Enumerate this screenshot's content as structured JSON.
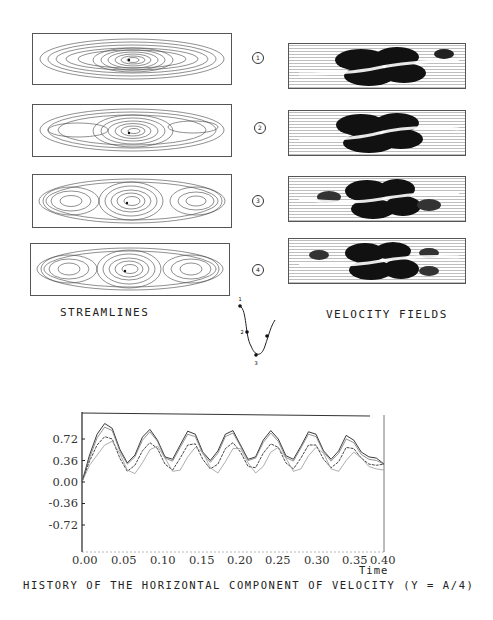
{
  "figure": {
    "streamlines_label": "STREAMLINES",
    "velocity_label": "VELOCITY FIELDS",
    "phase_markers": [
      "1",
      "2",
      "3",
      "4"
    ],
    "phase_diagram_points": [
      "1",
      "2",
      "3"
    ],
    "caption": "HISTORY OF THE HORIZONTAL COMPONENT OF VELOCITY (Y = A/4)"
  },
  "chart_data": {
    "type": "line",
    "title": "HISTORY OF THE HORIZONTAL COMPONENT OF VELOCITY (Y = A/4)",
    "xlabel": "Time",
    "ylabel": "",
    "x_ticks": [
      "0.00",
      "0.05",
      "0.10",
      "0.15",
      "0.20",
      "0.25",
      "0.30",
      "0.35",
      "0.40"
    ],
    "y_ticks": [
      "0.72",
      "0.36",
      "0.00",
      "-0.36",
      "-0.72"
    ],
    "xlim": [
      0.0,
      0.4
    ],
    "ylim": [
      -0.95,
      1.05
    ],
    "grid": false,
    "x": [
      0.0,
      0.01,
      0.02,
      0.03,
      0.04,
      0.05,
      0.06,
      0.07,
      0.08,
      0.09,
      0.1,
      0.11,
      0.12,
      0.13,
      0.14,
      0.15,
      0.16,
      0.17,
      0.18,
      0.19,
      0.2,
      0.21,
      0.22,
      0.23,
      0.24,
      0.25,
      0.26,
      0.27,
      0.28,
      0.29,
      0.3,
      0.31,
      0.32,
      0.33,
      0.34,
      0.35,
      0.36,
      0.37,
      0.38,
      0.39,
      0.4
    ],
    "series": [
      {
        "name": "upper-1",
        "values": [
          0.0,
          0.45,
          0.8,
          0.98,
          0.9,
          0.55,
          0.32,
          0.45,
          0.75,
          0.88,
          0.7,
          0.42,
          0.38,
          0.62,
          0.85,
          0.8,
          0.5,
          0.36,
          0.52,
          0.8,
          0.86,
          0.62,
          0.38,
          0.42,
          0.7,
          0.86,
          0.72,
          0.44,
          0.38,
          0.6,
          0.84,
          0.8,
          0.52,
          0.38,
          0.52,
          0.78,
          0.7,
          0.5,
          0.42,
          0.4,
          0.3
        ]
      },
      {
        "name": "upper-2",
        "values": [
          0.0,
          0.4,
          0.74,
          0.92,
          0.86,
          0.52,
          0.3,
          0.42,
          0.7,
          0.84,
          0.68,
          0.4,
          0.35,
          0.58,
          0.8,
          0.76,
          0.47,
          0.33,
          0.48,
          0.76,
          0.82,
          0.6,
          0.36,
          0.4,
          0.66,
          0.82,
          0.68,
          0.41,
          0.35,
          0.57,
          0.8,
          0.76,
          0.5,
          0.35,
          0.48,
          0.72,
          0.66,
          0.46,
          0.38,
          0.36,
          0.3
        ]
      },
      {
        "name": "middle",
        "values": [
          0.0,
          0.35,
          0.62,
          0.76,
          0.72,
          0.4,
          0.18,
          0.28,
          0.52,
          0.66,
          0.56,
          0.3,
          0.2,
          0.4,
          0.62,
          0.64,
          0.38,
          0.22,
          0.3,
          0.56,
          0.66,
          0.5,
          0.26,
          0.24,
          0.48,
          0.64,
          0.58,
          0.32,
          0.22,
          0.4,
          0.62,
          0.62,
          0.38,
          0.24,
          0.34,
          0.58,
          0.56,
          0.4,
          0.3,
          0.28,
          0.3
        ]
      },
      {
        "name": "lower",
        "values": [
          0.0,
          0.28,
          0.45,
          0.62,
          0.68,
          0.48,
          0.2,
          0.14,
          0.32,
          0.54,
          0.6,
          0.4,
          0.18,
          0.2,
          0.42,
          0.58,
          0.5,
          0.24,
          0.15,
          0.34,
          0.56,
          0.56,
          0.32,
          0.15,
          0.26,
          0.5,
          0.58,
          0.4,
          0.18,
          0.22,
          0.44,
          0.58,
          0.48,
          0.22,
          0.18,
          0.36,
          0.5,
          0.4,
          0.26,
          0.22,
          0.2
        ]
      }
    ]
  }
}
